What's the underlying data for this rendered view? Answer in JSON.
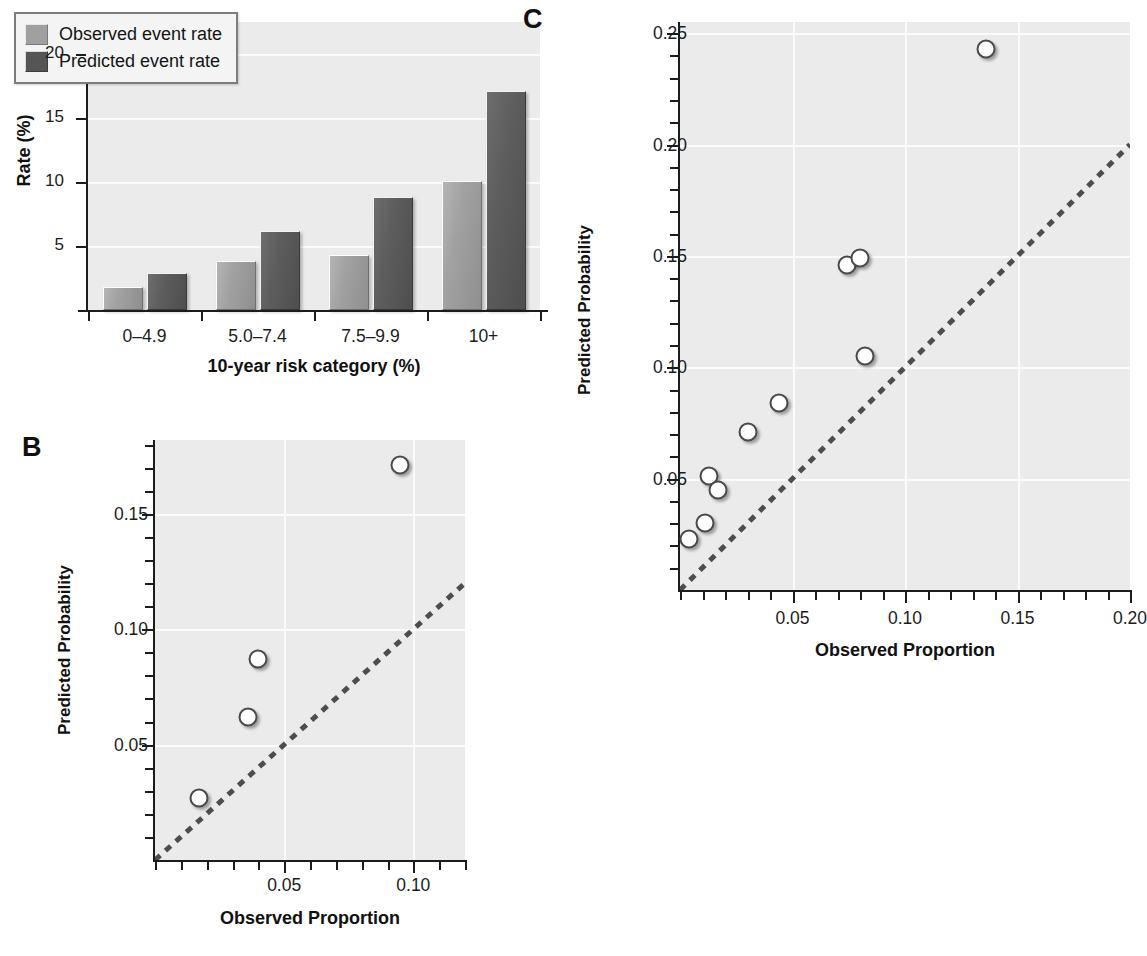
{
  "figure": {
    "panels": [
      {
        "letter": "A",
        "name": "bar-chart-panel"
      },
      {
        "letter": "B",
        "name": "calibration-scatter-panel-b"
      },
      {
        "letter": "C",
        "name": "calibration-scatter-panel-c"
      }
    ]
  },
  "panel_a": {
    "letter": "A",
    "legend": {
      "items": [
        {
          "label": "Observed event rate",
          "color": "#a0a0a0"
        },
        {
          "label": "Predicted event rate",
          "color": "#555555"
        }
      ]
    }
  },
  "panel_b": {
    "letter": "B"
  },
  "panel_c": {
    "letter": "C"
  },
  "chart_data": [
    {
      "panel": "A",
      "type": "bar",
      "title": "",
      "xlabel": "10-year risk category (%)",
      "ylabel": "Rate (%)",
      "categories": [
        "0–4.9",
        "5.0–7.4",
        "7.5–9.9",
        "10+"
      ],
      "yticks": [
        5,
        10,
        15,
        20
      ],
      "ytick_labels": [
        "5",
        "10",
        "15",
        "20"
      ],
      "ylim": [
        0,
        22.5
      ],
      "grid": "horizontal",
      "legend_position": "top-left",
      "series": [
        {
          "name": "Observed event rate",
          "color": "#a0a0a0",
          "values": [
            1.8,
            3.8,
            4.3,
            10.1
          ]
        },
        {
          "name": "Predicted event rate",
          "color": "#555555",
          "values": [
            2.9,
            6.2,
            8.8,
            17.1
          ]
        }
      ]
    },
    {
      "panel": "B",
      "type": "scatter",
      "title": "",
      "xlabel": "Observed Proportion",
      "ylabel": "Predicted Probability",
      "xlim": [
        0,
        0.12
      ],
      "ylim": [
        0,
        0.182
      ],
      "xticks": [
        0.05,
        0.1
      ],
      "xtick_labels": [
        "0.05",
        "0.10"
      ],
      "xminor_step": 0.01,
      "yticks": [
        0.05,
        0.1,
        0.15
      ],
      "ytick_labels": [
        "0.05",
        "0.10",
        "0.15"
      ],
      "yminor_step": 0.01,
      "grid": "both",
      "reference_line": {
        "type": "identity",
        "style": "dashed",
        "color": "#4d4d4d"
      },
      "points": [
        {
          "x": 0.017,
          "y": 0.027
        },
        {
          "x": 0.036,
          "y": 0.062
        },
        {
          "x": 0.04,
          "y": 0.087
        },
        {
          "x": 0.095,
          "y": 0.171
        }
      ]
    },
    {
      "panel": "C",
      "type": "scatter",
      "title": "",
      "xlabel": "Observed Proportion",
      "ylabel": "Predicted Probability",
      "xlim": [
        0,
        0.2
      ],
      "ylim": [
        0,
        0.255
      ],
      "xticks": [
        0.05,
        0.1,
        0.15,
        0.2
      ],
      "xtick_labels": [
        "0.05",
        "0.10",
        "0.15",
        "0.20"
      ],
      "xminor_step": 0.01,
      "yticks": [
        0.05,
        0.1,
        0.15,
        0.2,
        0.25
      ],
      "ytick_labels": [
        "0.05",
        "0.10",
        "0.15",
        "0.20",
        "0.25"
      ],
      "yminor_step": 0.01,
      "grid": "both",
      "reference_line": {
        "type": "identity",
        "style": "dashed",
        "color": "#4d4d4d"
      },
      "points": [
        {
          "x": 0.004,
          "y": 0.023
        },
        {
          "x": 0.011,
          "y": 0.03
        },
        {
          "x": 0.013,
          "y": 0.051
        },
        {
          "x": 0.017,
          "y": 0.045
        },
        {
          "x": 0.03,
          "y": 0.071
        },
        {
          "x": 0.044,
          "y": 0.084
        },
        {
          "x": 0.074,
          "y": 0.146
        },
        {
          "x": 0.08,
          "y": 0.149
        },
        {
          "x": 0.082,
          "y": 0.105
        },
        {
          "x": 0.136,
          "y": 0.243
        }
      ]
    }
  ]
}
